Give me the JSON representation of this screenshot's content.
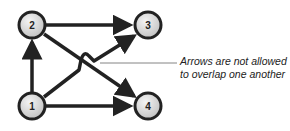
{
  "diagram": {
    "nodes": [
      {
        "id": "1",
        "label": "1",
        "x": 32,
        "y": 106
      },
      {
        "id": "2",
        "label": "2",
        "x": 32,
        "y": 25
      },
      {
        "id": "3",
        "label": "3",
        "x": 148,
        "y": 25
      },
      {
        "id": "4",
        "label": "4",
        "x": 148,
        "y": 106
      }
    ],
    "edges": [
      {
        "from": "1",
        "to": "2"
      },
      {
        "from": "2",
        "to": "3"
      },
      {
        "from": "2",
        "to": "4"
      },
      {
        "from": "1",
        "to": "3",
        "hop": true
      },
      {
        "from": "1",
        "to": "4"
      }
    ],
    "annotation": {
      "line1": "Arrows are not allowed",
      "line2": "to overlap one another"
    },
    "colors": {
      "stroke": "#222222",
      "node_fill": "#dcdcdc"
    }
  }
}
